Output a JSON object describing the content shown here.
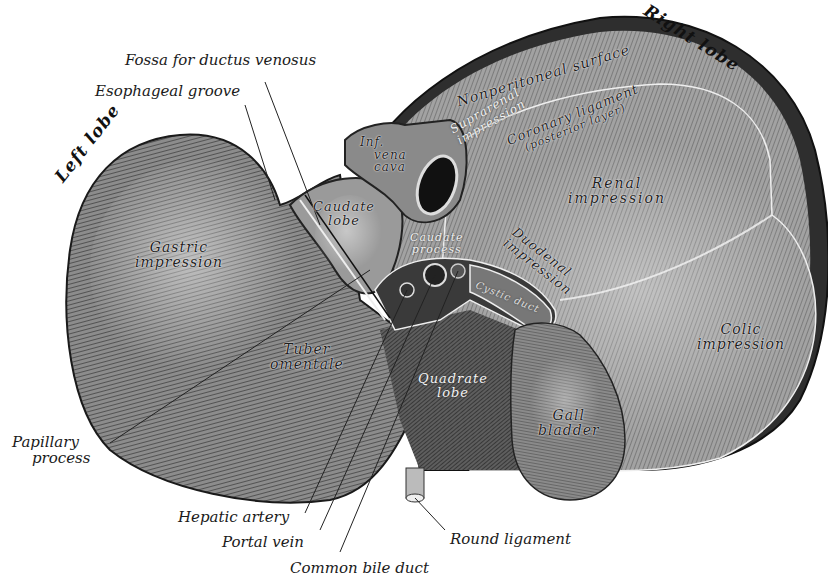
{
  "figure": {
    "colors": {
      "background": "#ffffff",
      "ink": "#1a1a1a",
      "left_lobe_fill": "#6e6e6e",
      "right_lobe_fill": "#8a8a8a",
      "dark_shadow": "#2a2a2a",
      "gall_bladder_fill": "#777777"
    }
  },
  "lobe_titles": {
    "left": "Left lobe",
    "right": "Right lobe"
  },
  "external_labels": {
    "fossa_ductus_venosus": "Fossa for ductus venosus",
    "esophageal_groove": "Esophageal groove",
    "papillary_process_line1": "Papillary",
    "papillary_process_line2": "process",
    "hepatic_artery": "Hepatic artery",
    "portal_vein": "Portal vein",
    "common_bile_duct": "Common bile duct",
    "round_ligament": "Round ligament"
  },
  "internal_labels": {
    "nonperitoneal_surface": "Nonperitoneal surface",
    "suprarenal_line1": "Suprarenal",
    "suprarenal_line2": "impression",
    "coronary_line1": "Coronary ligament",
    "coronary_line2": "(posterior layer)",
    "ivc_line1": "Inf.",
    "ivc_line2": "vena",
    "ivc_line3": "cava",
    "caudate_lobe_line1": "Caudate",
    "caudate_lobe_line2": "lobe",
    "caudate_process_line1": "Caudate",
    "caudate_process_line2": "process",
    "renal_line1": "Renal",
    "renal_line2": "impression",
    "duodenal_line1": "Duodenal",
    "duodenal_line2": "impression",
    "gastric_line1": "Gastric",
    "gastric_line2": "impression",
    "cystic_duct": "Cystic duct",
    "tuber_line1": "Tuber",
    "tuber_line2": "omentale",
    "quadrate_line1": "Quadrate",
    "quadrate_line2": "lobe",
    "gall_line1": "Gall",
    "gall_line2": "bladder",
    "colic_line1": "Colic",
    "colic_line2": "impression"
  }
}
